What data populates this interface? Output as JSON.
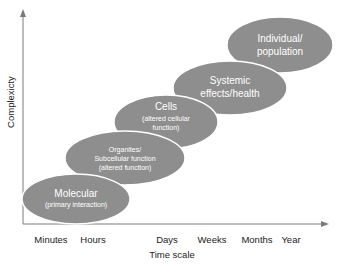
{
  "diagram": {
    "y_axis_label": "Complexicty",
    "x_axis_label": "Time scale",
    "x_ticks": [
      "Minutes",
      "Hours",
      "Days",
      "Weeks",
      "Months",
      "Year"
    ],
    "colors": {
      "ellipse_fill": "#8e8e8e",
      "ellipse_stroke": "#ffffff",
      "axis": "#7a7a7a",
      "text_light": "#ffffff",
      "text_dark": "#222222"
    },
    "levels": [
      {
        "title": "Molecular",
        "subtitle": "(primary interaction)"
      },
      {
        "title": "Organites/",
        "line2": "Subcellular function",
        "subtitle": "(altered function)"
      },
      {
        "title": "Cells",
        "subtitle": "(altered cellular",
        "subtitle2": "function)"
      },
      {
        "title": "Systemic",
        "line2": "effects/health"
      },
      {
        "title": "Individual/",
        "line2": "population"
      }
    ]
  }
}
